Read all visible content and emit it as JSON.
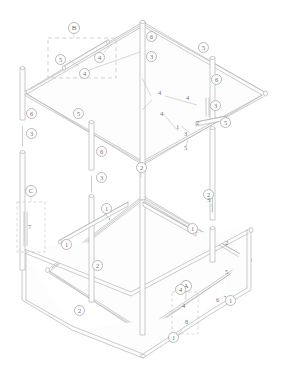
{
  "figure": {
    "type": "isometric-technical-drawing",
    "line_color": "#b5b5b5",
    "tube_fill": "#fdfdfd",
    "label_color": "#6f6f6f",
    "dash_color": "#bfbfbf",
    "background": "#ffffff",
    "width": 286,
    "height": 368
  },
  "detail_boxes": [
    {
      "id": "B",
      "label": "B",
      "x": 48,
      "y": 38,
      "w": 68,
      "h": 40,
      "tag_x": 74,
      "tag_y": 26
    },
    {
      "id": "C",
      "label": "C",
      "x": 17,
      "y": 202,
      "w": 28,
      "h": 50,
      "tag_x": 31,
      "tag_y": 189
    },
    {
      "id": "A",
      "label": "A",
      "x": 172,
      "y": 292,
      "w": 26,
      "h": 42,
      "tag_x": 186,
      "tag_y": 283
    }
  ],
  "circled_callouts": [
    {
      "n": "5",
      "x": 60,
      "y": 59
    },
    {
      "n": "4",
      "x": 99,
      "y": 57
    },
    {
      "n": "4",
      "x": 84,
      "y": 73
    },
    {
      "n": "6",
      "x": 151,
      "y": 36
    },
    {
      "n": "3",
      "x": 151,
      "y": 56
    },
    {
      "n": "5",
      "x": 203,
      "y": 47
    },
    {
      "n": "6",
      "x": 216,
      "y": 79
    },
    {
      "n": "3",
      "x": 215,
      "y": 105
    },
    {
      "n": "5",
      "x": 225,
      "y": 122
    },
    {
      "n": "6",
      "x": 31,
      "y": 113
    },
    {
      "n": "3",
      "x": 31,
      "y": 133
    },
    {
      "n": "5",
      "x": 78,
      "y": 113
    },
    {
      "n": "6",
      "x": 101,
      "y": 151
    },
    {
      "n": "3",
      "x": 101,
      "y": 177
    },
    {
      "n": "2",
      "x": 141,
      "y": 167
    },
    {
      "n": "1",
      "x": 106,
      "y": 208
    },
    {
      "n": "1",
      "x": 192,
      "y": 228
    },
    {
      "n": "2",
      "x": 208,
      "y": 194
    },
    {
      "n": "1",
      "x": 66,
      "y": 244
    },
    {
      "n": "2",
      "x": 97,
      "y": 265
    },
    {
      "n": "2",
      "x": 79,
      "y": 310
    },
    {
      "n": "1",
      "x": 230,
      "y": 300
    },
    {
      "n": "4",
      "x": 180,
      "y": 289
    },
    {
      "n": "1",
      "x": 173,
      "y": 337
    }
  ],
  "plain_callouts": [
    {
      "n": "4",
      "x": 158,
      "y": 93
    },
    {
      "n": "4",
      "x": 186,
      "y": 98
    },
    {
      "n": "4",
      "x": 160,
      "y": 114
    },
    {
      "n": "1",
      "x": 176,
      "y": 127
    },
    {
      "n": "2",
      "x": 196,
      "y": 123
    },
    {
      "n": "3",
      "x": 184,
      "y": 134
    },
    {
      "n": "5",
      "x": 184,
      "y": 148
    },
    {
      "n": "3",
      "x": 207,
      "y": 200
    },
    {
      "n": "2",
      "x": 225,
      "y": 243
    },
    {
      "n": "5",
      "x": 225,
      "y": 272
    },
    {
      "n": "6",
      "x": 219,
      "y": 300
    },
    {
      "n": "7",
      "x": 29,
      "y": 227
    },
    {
      "n": "4",
      "x": 183,
      "y": 306
    },
    {
      "n": "8",
      "x": 186,
      "y": 322
    }
  ]
}
